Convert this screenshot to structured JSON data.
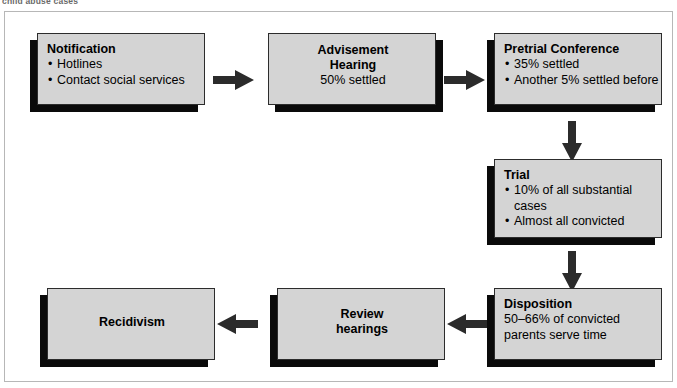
{
  "caption": "child abuse cases",
  "theme": {
    "box_fill": "#d4d4d4",
    "box_border": "#2c2c2c",
    "shadow": "#0a0a0a",
    "arrow": "#2b2b2b",
    "frame_border": "#b7b7b7",
    "page_background": "#ffffff"
  },
  "flowchart": {
    "type": "process-flow",
    "nodes": [
      {
        "id": "notification",
        "title": "Notification",
        "bullets": [
          "Hotlines",
          "Contact social services"
        ],
        "align": "left"
      },
      {
        "id": "advisement-hearing",
        "title_lines": [
          "Advisement",
          "Hearing"
        ],
        "lines": [
          "50% settled"
        ],
        "align": "center"
      },
      {
        "id": "pretrial-conference",
        "title": "Pretrial Conference",
        "bullets": [
          "35% settled",
          "Another 5% settled before"
        ],
        "align": "left"
      },
      {
        "id": "trial",
        "title": "Trial",
        "bullets": [
          "10% of all substantial",
          "Almost all convicted"
        ],
        "continuation": "cases",
        "align": "left"
      },
      {
        "id": "disposition",
        "title": "Disposition",
        "lines": [
          "50–66% of convicted",
          "parents serve time"
        ],
        "align": "left"
      },
      {
        "id": "review-hearings",
        "title_lines": [
          "Review",
          "hearings"
        ],
        "align": "center"
      },
      {
        "id": "recidivism",
        "title_lines": [
          "Recidivism"
        ],
        "align": "center"
      }
    ],
    "arrows": [
      {
        "id": "notification-to-advisement",
        "direction": "right"
      },
      {
        "id": "advisement-to-pretrial",
        "direction": "right"
      },
      {
        "id": "pretrial-to-trial",
        "direction": "down"
      },
      {
        "id": "trial-to-disposition",
        "direction": "down"
      },
      {
        "id": "disposition-to-review",
        "direction": "left"
      },
      {
        "id": "review-to-recidivism",
        "direction": "left"
      }
    ]
  }
}
